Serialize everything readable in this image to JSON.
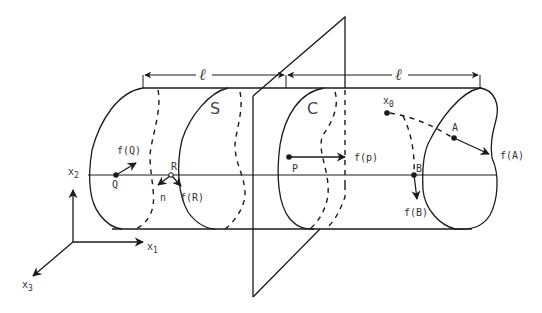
{
  "figure": {
    "dimension_labels": {
      "left": "ℓ",
      "right": "ℓ"
    },
    "region_labels": {
      "surface": "S",
      "cross_section": "C"
    },
    "points": {
      "Q": "Q",
      "R": "R",
      "P": "P",
      "B": "B",
      "A": "A",
      "x0_base": "x",
      "x0_sub": "0"
    },
    "vectors": {
      "fQ": "f(Q)",
      "fR": "f(R)",
      "fP": "f(p)",
      "fB": "f(B)",
      "fA": "f(A)",
      "normal": "n"
    },
    "axes": {
      "x1_base": "x",
      "x1_sub": "1",
      "x2_base": "x",
      "x2_sub": "2",
      "x3_base": "x",
      "x3_sub": "3"
    }
  }
}
